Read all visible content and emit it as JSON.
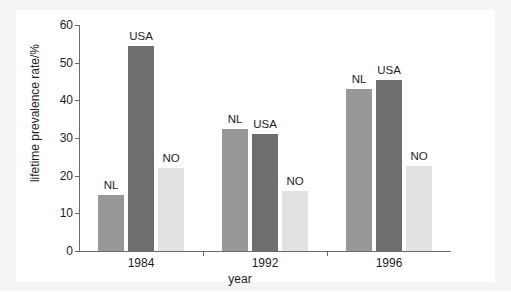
{
  "chart_data": {
    "type": "bar",
    "title": "",
    "xlabel": "year",
    "ylabel": "lifetime prevalence rate/%",
    "categories": [
      "1984",
      "1992",
      "1996"
    ],
    "ylim": [
      0,
      60
    ],
    "yticks": [
      0,
      10,
      20,
      30,
      40,
      50,
      60
    ],
    "grid": false,
    "legend": "none",
    "annotations_style": "series name printed above each bar",
    "series": [
      {
        "name": "NL",
        "color": "#989898",
        "values": [
          15,
          32.5,
          43
        ]
      },
      {
        "name": "USA",
        "color": "#6e6e6e",
        "values": [
          54.5,
          31,
          45.5
        ]
      },
      {
        "name": "NO",
        "color": "#e2e2e2",
        "values": [
          22,
          16,
          22.5
        ]
      }
    ],
    "bars": [
      {
        "group": "1984",
        "series": "NL",
        "value": 15,
        "label": "NL"
      },
      {
        "group": "1984",
        "series": "USA",
        "value": 54.5,
        "label": "USA"
      },
      {
        "group": "1984",
        "series": "NO",
        "value": 22,
        "label": "NO"
      },
      {
        "group": "1992",
        "series": "NL",
        "value": 32.5,
        "label": "NL"
      },
      {
        "group": "1992",
        "series": "USA",
        "value": 31,
        "label": "USA"
      },
      {
        "group": "1992",
        "series": "NO",
        "value": 16,
        "label": "NO"
      },
      {
        "group": "1996",
        "series": "NL",
        "value": 43,
        "label": "NL"
      },
      {
        "group": "1996",
        "series": "USA",
        "value": 45.5,
        "label": "USA"
      },
      {
        "group": "1996",
        "series": "NO",
        "value": 22.5,
        "label": "NO"
      }
    ]
  },
  "axes": {
    "y_tick_labels": [
      "0",
      "10",
      "20",
      "30",
      "40",
      "50",
      "60"
    ],
    "x_tick_labels": [
      "1984",
      "1992",
      "1996"
    ],
    "y_axis_title": "lifetime prevalence rate/%",
    "x_axis_title": "year"
  },
  "colors": {
    "nl": "#989898",
    "usa": "#6e6e6e",
    "no": "#e2e2e2",
    "axis": "#6b6b6b",
    "text": "#1d1d1d",
    "plot_background": "#ffffff",
    "figure_background": "#f4f4f4"
  }
}
